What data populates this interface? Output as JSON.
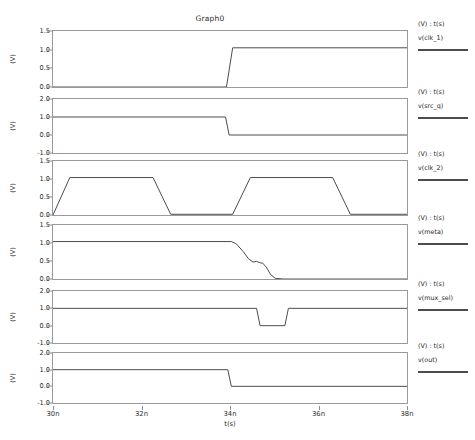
{
  "chart_data": {
    "type": "line",
    "title": "Graph0",
    "xlabel": "t(s)",
    "ylabel": "(V)",
    "xlim": [
      30,
      38
    ],
    "xunit": "n",
    "xticks": [
      30,
      32,
      34,
      36,
      38
    ],
    "xticklabels": [
      "30n",
      "32n",
      "34n",
      "36n",
      "38n"
    ],
    "grid": false,
    "legend_position": "right",
    "legend_header": "(V) : t(s)",
    "trace_color": "#4c4c4c",
    "axis_color": "#9a9a9a",
    "panels": [
      {
        "name": "v(clk_1)",
        "legend_header": "(V) : t(s)",
        "ylim": [
          0.0,
          1.5
        ],
        "yticks": [
          0.0,
          0.5,
          1.0,
          1.5
        ],
        "yticklabels": [
          "0.0",
          "0.5",
          "1.0",
          "1.5"
        ],
        "ylabel": "(V)",
        "points": [
          [
            30.0,
            0.0
          ],
          [
            33.92,
            0.0
          ],
          [
            34.06,
            1.05
          ],
          [
            38.0,
            1.05
          ]
        ]
      },
      {
        "name": "v(src_q)",
        "legend_header": "(V) : t(s)",
        "ylim": [
          -1.0,
          2.0
        ],
        "yticks": [
          -1.0,
          0.0,
          1.0,
          2.0
        ],
        "yticklabels": [
          "-1.0",
          "0.0",
          "1.0",
          "2.0"
        ],
        "ylabel": "(V)",
        "points": [
          [
            30.0,
            1.0
          ],
          [
            33.9,
            1.0
          ],
          [
            33.98,
            0.0
          ],
          [
            38.0,
            0.0
          ]
        ]
      },
      {
        "name": "v(clk_2)",
        "legend_header": "(V) : t(s)",
        "ylim": [
          0.0,
          1.5
        ],
        "yticks": [
          0.0,
          0.5,
          1.0,
          1.5
        ],
        "yticklabels": [
          "0.0",
          "0.5",
          "1.0",
          "1.5"
        ],
        "ylabel": "(V)",
        "points": [
          [
            30.0,
            0.0
          ],
          [
            30.38,
            1.04
          ],
          [
            32.26,
            1.04
          ],
          [
            32.66,
            0.02
          ],
          [
            34.06,
            0.02
          ],
          [
            34.46,
            1.04
          ],
          [
            36.32,
            1.04
          ],
          [
            36.72,
            0.02
          ],
          [
            38.0,
            0.02
          ]
        ]
      },
      {
        "name": "v(meta)",
        "legend_header": "(V) : t(s)",
        "ylim": [
          0.0,
          1.5
        ],
        "yticks": [
          0.0,
          0.5,
          1.0,
          1.5
        ],
        "yticklabels": [
          "0.0",
          "0.5",
          "1.0",
          "1.5"
        ],
        "ylabel": "(V)",
        "points": [
          [
            30.0,
            1.04
          ],
          [
            34.03,
            1.04
          ],
          [
            34.14,
            0.98
          ],
          [
            34.3,
            0.76
          ],
          [
            34.42,
            0.56
          ],
          [
            34.52,
            0.47
          ],
          [
            34.6,
            0.49
          ],
          [
            34.68,
            0.45
          ],
          [
            34.74,
            0.44
          ],
          [
            34.82,
            0.33
          ],
          [
            34.92,
            0.12
          ],
          [
            35.02,
            0.02
          ],
          [
            35.2,
            0.0
          ],
          [
            38.0,
            0.0
          ]
        ]
      },
      {
        "name": "v(mux_sel)",
        "legend_header": "(V) : t(s)",
        "ylim": [
          -1.0,
          2.0
        ],
        "yticks": [
          -1.0,
          0.0,
          1.0,
          2.0
        ],
        "yticklabels": [
          "-1.0",
          "0.0",
          "1.0",
          "2.0"
        ],
        "ylabel": "(V)",
        "points": [
          [
            30.0,
            1.0
          ],
          [
            34.6,
            1.0
          ],
          [
            34.68,
            0.0
          ],
          [
            35.24,
            0.0
          ],
          [
            35.32,
            1.0
          ],
          [
            38.0,
            1.0
          ]
        ]
      },
      {
        "name": "v(out)",
        "legend_header": "(V) : t(s)",
        "ylim": [
          -1.0,
          2.0
        ],
        "yticks": [
          -1.0,
          0.0,
          1.0,
          2.0
        ],
        "yticklabels": [
          "-1.0",
          "0.0",
          "1.0",
          "2.0"
        ],
        "ylabel": "(V)",
        "points": [
          [
            30.0,
            1.0
          ],
          [
            33.95,
            1.0
          ],
          [
            34.03,
            0.0
          ],
          [
            38.0,
            0.0
          ]
        ]
      }
    ]
  }
}
